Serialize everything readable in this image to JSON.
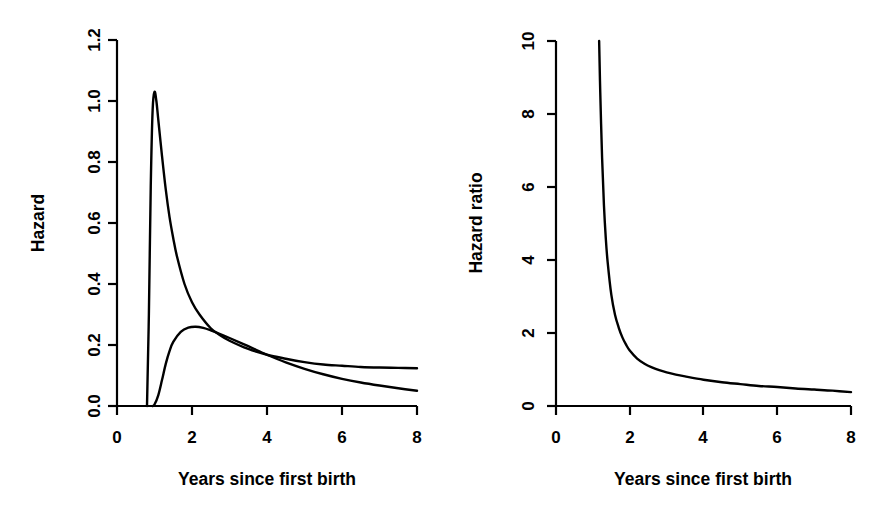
{
  "figure": {
    "background": "#ffffff",
    "foreground": "#000000",
    "panel_count": 2
  },
  "chart_data": [
    {
      "panel": "left",
      "type": "line",
      "title": "",
      "xlabel": "Years since first birth",
      "ylabel": "Hazard",
      "xlim": [
        0,
        8
      ],
      "ylim": [
        0,
        1.2
      ],
      "xticks": [
        0,
        2,
        4,
        6,
        8
      ],
      "xticklabels": [
        "0",
        "2",
        "4",
        "6",
        "8"
      ],
      "yticks": [
        0.0,
        0.2,
        0.4,
        0.6,
        0.8,
        1.0,
        1.2
      ],
      "yticklabels": [
        "0.0",
        "0.2",
        "0.4",
        "0.6",
        "0.8",
        "1.0",
        "1.2"
      ],
      "grid": false,
      "legend": false,
      "legend_position": "none",
      "series": [
        {
          "name": "hazard-curve-peaked",
          "color": "#000000",
          "description": "Sharp unimodal hazard rising from zero just before year 1, peaking at about 1.03 near year 1.0, then decaying",
          "x": [
            0.8,
            0.85,
            0.9,
            0.95,
            1.0,
            1.05,
            1.1,
            1.2,
            1.3,
            1.4,
            1.5,
            1.6,
            1.8,
            2.0,
            2.2,
            2.5,
            2.75,
            3.0,
            3.5,
            4.0,
            4.5,
            5.0,
            5.5,
            6.0,
            6.5,
            7.0,
            7.5,
            8.0
          ],
          "y": [
            0.0,
            0.3,
            0.72,
            0.97,
            1.03,
            1.0,
            0.94,
            0.82,
            0.71,
            0.62,
            0.55,
            0.49,
            0.4,
            0.34,
            0.3,
            0.255,
            0.232,
            0.214,
            0.187,
            0.168,
            0.155,
            0.144,
            0.136,
            0.132,
            0.128,
            0.126,
            0.125,
            0.124
          ]
        },
        {
          "name": "hazard-curve-broad",
          "color": "#000000",
          "description": "Broad low hazard rising from zero near year 1, peaking at about 0.26 near year 2.1, then slowly decaying to about 0.05",
          "x": [
            0.95,
            1.0,
            1.1,
            1.2,
            1.3,
            1.4,
            1.5,
            1.7,
            1.9,
            2.1,
            2.3,
            2.5,
            2.75,
            3.0,
            3.5,
            4.0,
            4.5,
            5.0,
            5.5,
            6.0,
            6.5,
            7.0,
            7.5,
            8.0
          ],
          "y": [
            0.0,
            0.005,
            0.035,
            0.085,
            0.138,
            0.18,
            0.21,
            0.243,
            0.257,
            0.26,
            0.256,
            0.248,
            0.236,
            0.223,
            0.196,
            0.168,
            0.143,
            0.122,
            0.104,
            0.089,
            0.077,
            0.067,
            0.058,
            0.05
          ]
        }
      ],
      "annotations": [
        {
          "text": "curves cross near 2.9 years at a hazard of about 0.24"
        }
      ]
    },
    {
      "panel": "right",
      "type": "line",
      "title": "",
      "xlabel": "Years since first birth",
      "ylabel": "Hazard ratio",
      "xlim": [
        0,
        8
      ],
      "ylim": [
        0,
        10
      ],
      "xticks": [
        0,
        2,
        4,
        6,
        8
      ],
      "xticklabels": [
        "0",
        "2",
        "4",
        "6",
        "8"
      ],
      "yticks": [
        0,
        2,
        4,
        6,
        8,
        10
      ],
      "yticklabels": [
        "0",
        "2",
        "4",
        "6",
        "8",
        "10"
      ],
      "grid": false,
      "legend": false,
      "legend_position": "none",
      "series": [
        {
          "name": "hazard-ratio-curve",
          "color": "#000000",
          "description": "Ratio of the two hazards, entering the plot at 10 just after year 1.15 and decaying monotonically to about 0.38 at year 8",
          "x": [
            1.17,
            1.2,
            1.25,
            1.3,
            1.35,
            1.4,
            1.5,
            1.6,
            1.7,
            1.8,
            1.9,
            2.0,
            2.2,
            2.4,
            2.6,
            2.8,
            3.0,
            3.25,
            3.5,
            4.0,
            4.5,
            5.0,
            5.5,
            6.0,
            6.5,
            7.0,
            7.5,
            8.0
          ],
          "y": [
            10.0,
            8.6,
            6.8,
            5.5,
            4.6,
            3.95,
            3.05,
            2.5,
            2.15,
            1.88,
            1.68,
            1.52,
            1.3,
            1.16,
            1.06,
            0.98,
            0.92,
            0.86,
            0.81,
            0.72,
            0.65,
            0.6,
            0.55,
            0.52,
            0.48,
            0.45,
            0.42,
            0.38
          ]
        }
      ],
      "annotations": [
        {
          "text": "curve is truncated at the top of the plotting region (value 10)"
        }
      ]
    }
  ]
}
